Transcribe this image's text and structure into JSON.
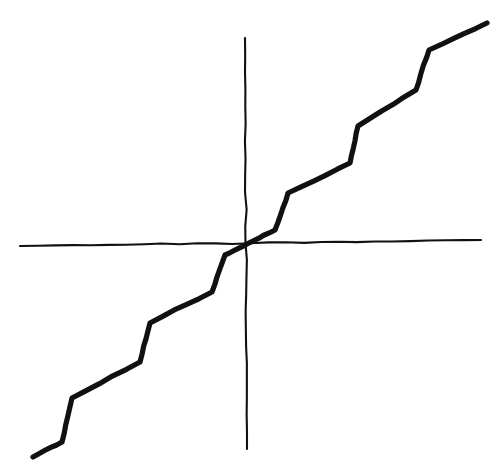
{
  "figure": {
    "title": "",
    "background_color": "#ffffff",
    "ink_color": "#111111",
    "width": 502,
    "height": 473,
    "style": "hand-drawn pen sketch"
  },
  "chart_data": {
    "type": "line",
    "title": "",
    "subtitle": "",
    "xlabel": "",
    "ylabel": "",
    "grid": false,
    "legend": null,
    "annotations": [],
    "axes": {
      "origin_px": [
        247,
        244
      ],
      "x_axis": {
        "label": "",
        "tick_labels": [],
        "start_px": [
          20,
          246
        ],
        "end_px": [
          481,
          240
        ],
        "stroke_width": 2
      },
      "y_axis": {
        "label": "",
        "tick_labels": [],
        "start_px": [
          245,
          38
        ],
        "end_px": [
          247,
          449
        ],
        "stroke_width": 2
      }
    },
    "series": [
      {
        "name": "staircase-curve",
        "description": "Monotonic increasing hand-drawn staircase / step-like curve passing through the origin, odd-symmetric about the origin",
        "stroke_width": 5,
        "points_px": [
          [
            33,
            457
          ],
          [
            62,
            442
          ],
          [
            72,
            398
          ],
          [
            140,
            362
          ],
          [
            150,
            323
          ],
          [
            212,
            292
          ],
          [
            225,
            255
          ],
          [
            247,
            244
          ],
          [
            275,
            230
          ],
          [
            288,
            193
          ],
          [
            350,
            163
          ],
          [
            358,
            126
          ],
          [
            416,
            90
          ],
          [
            429,
            50
          ],
          [
            487,
            23
          ]
        ],
        "normalized_points": [
          [
            -0.46,
            -0.52
          ],
          [
            -0.4,
            -0.47
          ],
          [
            -0.38,
            -0.37
          ],
          [
            -0.23,
            -0.28
          ],
          [
            -0.21,
            -0.19
          ],
          [
            -0.08,
            -0.12
          ],
          [
            -0.05,
            -0.03
          ],
          [
            0.0,
            0.0
          ],
          [
            0.06,
            0.03
          ],
          [
            0.09,
            0.12
          ],
          [
            0.22,
            0.19
          ],
          [
            0.24,
            0.28
          ],
          [
            0.36,
            0.37
          ],
          [
            0.39,
            0.47
          ],
          [
            0.52,
            0.53
          ]
        ],
        "step_count": 7
      }
    ]
  }
}
